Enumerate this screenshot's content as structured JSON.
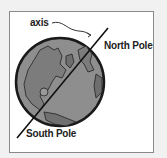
{
  "diagram": {
    "labels": {
      "axis": "axis",
      "north_pole": "North Pole",
      "south_pole": "South Pole"
    },
    "colors": {
      "ocean": "#8c8c8c",
      "land": "#7a7a7a",
      "outline": "#1a1a1a",
      "frame_border": "#8a8a8a",
      "background": "#f1f1f1"
    }
  }
}
